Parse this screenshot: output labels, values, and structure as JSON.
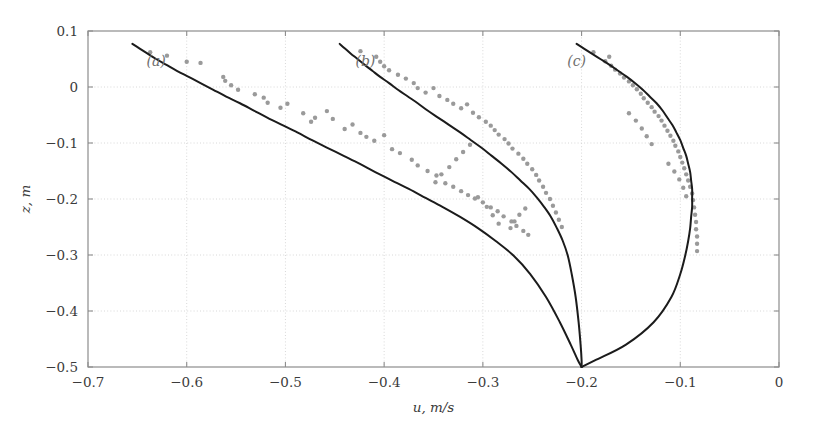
{
  "figure": {
    "width": 817,
    "height": 422,
    "background": "#ffffff"
  },
  "axes": {
    "frame_color": "#8d8d8d",
    "grid_color": "#d8d8d8",
    "left_px": 88,
    "right_px": 779,
    "top_px": 31,
    "bottom_px": 367
  },
  "labels": {
    "x_axis_title": "u, m/s",
    "y_axis_title": "z, m",
    "curve_a": "(a)",
    "curve_b": "(b)",
    "curve_c": "(c)"
  },
  "ticks": {
    "x_labels": [
      "-0.7",
      "-0.6",
      "-0.5",
      "-0.4",
      "-0.3",
      "-0.2",
      "-0.1",
      "0"
    ],
    "y_labels": [
      "0.1",
      "0",
      "-0.1",
      "-0.2",
      "-0.3",
      "-0.4",
      "-0.5"
    ]
  },
  "chart_data": {
    "type": "line",
    "title": "",
    "xlabel": "u, m/s",
    "ylabel": "z, m",
    "xlim": [
      -0.7,
      0.0
    ],
    "ylim": [
      -0.5,
      0.1
    ],
    "xticks": [
      -0.7,
      -0.6,
      -0.5,
      -0.4,
      -0.3,
      -0.2,
      -0.1,
      0
    ],
    "yticks": [
      0.1,
      0,
      -0.1,
      -0.2,
      -0.3,
      -0.4,
      -0.5
    ],
    "grid": true,
    "grid_style": "dotted",
    "legend": "none",
    "orientation": "vertical-profile",
    "annotations": [
      {
        "text": "(a)",
        "x": -0.631,
        "y": 0.0375
      },
      {
        "text": "(b)",
        "x": -0.419,
        "y": 0.0375
      },
      {
        "text": "(c)",
        "x": -0.205,
        "y": 0.0375
      }
    ],
    "series": [
      {
        "name": "(a)",
        "kind": "line",
        "color": "#1b1b1b",
        "linewidth": 2.0,
        "comment": "u velocity profile a: x = u (m/s), y = z (m)",
        "x": [
          -0.655,
          -0.648,
          -0.64,
          -0.631,
          -0.621,
          -0.61,
          -0.598,
          -0.586,
          -0.573,
          -0.56,
          -0.546,
          -0.532,
          -0.518,
          -0.503,
          -0.488,
          -0.473,
          -0.457,
          -0.441,
          -0.425,
          -0.409,
          -0.392,
          -0.375,
          -0.358,
          -0.341,
          -0.323,
          -0.305,
          -0.287,
          -0.269,
          -0.252,
          -0.236,
          -0.222,
          -0.211,
          -0.204,
          -0.2
        ],
        "y": [
          0.077,
          0.069,
          0.06,
          0.05,
          0.04,
          0.029,
          0.018,
          0.007,
          -0.005,
          -0.017,
          -0.029,
          -0.042,
          -0.055,
          -0.068,
          -0.081,
          -0.095,
          -0.109,
          -0.123,
          -0.137,
          -0.152,
          -0.167,
          -0.182,
          -0.198,
          -0.214,
          -0.232,
          -0.252,
          -0.275,
          -0.301,
          -0.334,
          -0.375,
          -0.42,
          -0.46,
          -0.487,
          -0.5
        ]
      },
      {
        "name": "(b)",
        "kind": "line",
        "color": "#1b1b1b",
        "linewidth": 2.0,
        "comment": "u velocity profile b: x = u (m/s), y = z (m)",
        "x": [
          -0.445,
          -0.44,
          -0.434,
          -0.427,
          -0.42,
          -0.412,
          -0.404,
          -0.395,
          -0.386,
          -0.376,
          -0.366,
          -0.356,
          -0.345,
          -0.334,
          -0.323,
          -0.312,
          -0.301,
          -0.291,
          -0.281,
          -0.271,
          -0.262,
          -0.253,
          -0.245,
          -0.238,
          -0.231,
          -0.225,
          -0.219,
          -0.214,
          -0.21,
          -0.206,
          -0.203,
          -0.201,
          -0.2,
          -0.2
        ],
        "y": [
          0.077,
          0.069,
          0.06,
          0.05,
          0.04,
          0.029,
          0.018,
          0.007,
          -0.005,
          -0.017,
          -0.029,
          -0.042,
          -0.055,
          -0.068,
          -0.081,
          -0.095,
          -0.109,
          -0.123,
          -0.137,
          -0.152,
          -0.167,
          -0.182,
          -0.198,
          -0.214,
          -0.232,
          -0.252,
          -0.275,
          -0.301,
          -0.334,
          -0.375,
          -0.42,
          -0.46,
          -0.487,
          -0.5
        ]
      },
      {
        "name": "(c)",
        "kind": "line",
        "color": "#1b1b1b",
        "linewidth": 2.0,
        "comment": "u velocity profile c: x = u (m/s), y = z (m); bulges right to ~-0.088",
        "x": [
          -0.205,
          -0.198,
          -0.19,
          -0.181,
          -0.172,
          -0.163,
          -0.154,
          -0.146,
          -0.138,
          -0.131,
          -0.124,
          -0.118,
          -0.113,
          -0.108,
          -0.104,
          -0.1,
          -0.097,
          -0.094,
          -0.092,
          -0.09,
          -0.089,
          -0.088,
          -0.088,
          -0.088,
          -0.089,
          -0.09,
          -0.092,
          -0.095,
          -0.1,
          -0.109,
          -0.127,
          -0.155,
          -0.185,
          -0.2
        ],
        "y": [
          0.077,
          0.069,
          0.06,
          0.05,
          0.04,
          0.029,
          0.018,
          0.007,
          -0.005,
          -0.017,
          -0.029,
          -0.042,
          -0.055,
          -0.068,
          -0.081,
          -0.095,
          -0.109,
          -0.123,
          -0.137,
          -0.152,
          -0.167,
          -0.182,
          -0.198,
          -0.214,
          -0.232,
          -0.252,
          -0.275,
          -0.301,
          -0.334,
          -0.375,
          -0.42,
          -0.46,
          -0.487,
          -0.5
        ]
      },
      {
        "name": "(a) measurements",
        "kind": "scatter",
        "color": "#9a9a9a",
        "marker": "dot",
        "markersize": 2.2,
        "x": [
          -0.637,
          -0.62,
          -0.6,
          -0.586,
          -0.563,
          -0.561,
          -0.555,
          -0.548,
          -0.531,
          -0.522,
          -0.518,
          -0.505,
          -0.498,
          -0.482,
          -0.47,
          -0.474,
          -0.458,
          -0.452,
          -0.44,
          -0.432,
          -0.424,
          -0.418,
          -0.41,
          -0.4,
          -0.392,
          -0.384,
          -0.372,
          -0.366,
          -0.356,
          -0.347,
          -0.338,
          -0.33,
          -0.322,
          -0.315,
          -0.308,
          -0.3,
          -0.292,
          -0.285,
          -0.279,
          -0.271,
          -0.266,
          -0.259,
          -0.254,
          -0.305,
          -0.296,
          -0.29,
          -0.284
        ],
        "y": [
          0.062,
          0.056,
          0.045,
          0.043,
          0.018,
          0.011,
          0.003,
          -0.005,
          -0.013,
          -0.019,
          -0.028,
          -0.037,
          -0.03,
          -0.047,
          -0.055,
          -0.062,
          -0.043,
          -0.057,
          -0.075,
          -0.067,
          -0.082,
          -0.089,
          -0.096,
          -0.086,
          -0.111,
          -0.118,
          -0.13,
          -0.14,
          -0.15,
          -0.158,
          -0.172,
          -0.178,
          -0.186,
          -0.193,
          -0.199,
          -0.206,
          -0.215,
          -0.222,
          -0.231,
          -0.24,
          -0.248,
          -0.257,
          -0.264,
          -0.197,
          -0.214,
          -0.229,
          -0.244
        ]
      },
      {
        "name": "(b) measurements",
        "kind": "scatter",
        "color": "#9a9a9a",
        "marker": "dot",
        "markersize": 2.2,
        "x": [
          -0.424,
          -0.408,
          -0.404,
          -0.4,
          -0.395,
          -0.386,
          -0.378,
          -0.37,
          -0.366,
          -0.358,
          -0.35,
          -0.344,
          -0.336,
          -0.33,
          -0.322,
          -0.316,
          -0.31,
          -0.304,
          -0.297,
          -0.292,
          -0.288,
          -0.284,
          -0.278,
          -0.274,
          -0.27,
          -0.264,
          -0.259,
          -0.255,
          -0.25,
          -0.246,
          -0.243,
          -0.239,
          -0.236,
          -0.232,
          -0.229,
          -0.226,
          -0.223,
          -0.22,
          -0.257,
          -0.263,
          -0.268,
          -0.272,
          -0.313,
          -0.32,
          -0.327,
          -0.334,
          -0.342,
          -0.348
        ],
        "y": [
          0.064,
          0.054,
          0.045,
          0.037,
          0.03,
          0.022,
          0.015,
          0.007,
          -0.002,
          -0.01,
          -0.002,
          -0.016,
          -0.023,
          -0.03,
          -0.038,
          -0.031,
          -0.046,
          -0.054,
          -0.062,
          -0.069,
          -0.077,
          -0.085,
          -0.093,
          -0.101,
          -0.11,
          -0.119,
          -0.128,
          -0.137,
          -0.147,
          -0.157,
          -0.167,
          -0.178,
          -0.189,
          -0.2,
          -0.212,
          -0.224,
          -0.237,
          -0.25,
          -0.217,
          -0.228,
          -0.24,
          -0.252,
          -0.103,
          -0.116,
          -0.129,
          -0.143,
          -0.156,
          -0.17
        ]
      },
      {
        "name": "(c) measurements",
        "kind": "scatter",
        "color": "#9a9a9a",
        "marker": "dot",
        "markersize": 2.2,
        "x": [
          -0.188,
          -0.172,
          -0.176,
          -0.17,
          -0.166,
          -0.161,
          -0.157,
          -0.152,
          -0.148,
          -0.144,
          -0.14,
          -0.137,
          -0.133,
          -0.129,
          -0.126,
          -0.122,
          -0.119,
          -0.116,
          -0.113,
          -0.11,
          -0.107,
          -0.105,
          -0.102,
          -0.1,
          -0.098,
          -0.096,
          -0.094,
          -0.092,
          -0.09,
          -0.088,
          -0.087,
          -0.086,
          -0.085,
          -0.084,
          -0.084,
          -0.083,
          -0.083,
          -0.083,
          -0.112,
          -0.106,
          -0.101,
          -0.097,
          -0.094,
          -0.152,
          -0.145,
          -0.139,
          -0.134,
          -0.129
        ],
        "y": [
          0.062,
          0.054,
          0.046,
          0.038,
          0.031,
          0.024,
          0.017,
          0.01,
          0.003,
          -0.004,
          -0.012,
          -0.02,
          -0.028,
          -0.036,
          -0.044,
          -0.052,
          -0.06,
          -0.069,
          -0.078,
          -0.087,
          -0.096,
          -0.105,
          -0.115,
          -0.125,
          -0.135,
          -0.145,
          -0.156,
          -0.167,
          -0.178,
          -0.19,
          -0.202,
          -0.215,
          -0.228,
          -0.241,
          -0.254,
          -0.267,
          -0.28,
          -0.293,
          -0.137,
          -0.151,
          -0.165,
          -0.18,
          -0.195,
          -0.047,
          -0.06,
          -0.074,
          -0.088,
          -0.102
        ]
      }
    ]
  }
}
